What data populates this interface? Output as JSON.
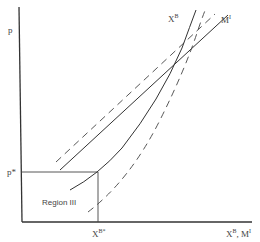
{
  "diagram": {
    "axes": {
      "y_label": "p",
      "x_label_main": "X",
      "x_label_main_sup": "B",
      "x_label_sep": ", ",
      "x_label_second": "M",
      "x_label_second_sup": "I"
    },
    "markers": {
      "p_star": "p*",
      "xb_star_main": "X",
      "xb_star_sup": "B*"
    },
    "region": {
      "label": "Region III"
    },
    "curves": {
      "xb_label_main": "X",
      "xb_label_sup": "B",
      "mi_label_main": "M",
      "mi_label_sup": "I",
      "items": [
        {
          "name": "X^B supply (solid)",
          "style": "solid"
        },
        {
          "name": "X^B shifted (dashed)",
          "style": "dashed"
        },
        {
          "name": "M^I import (solid)",
          "style": "solid"
        },
        {
          "name": "M^I shifted (dashed)",
          "style": "dashed"
        }
      ]
    },
    "colors": {
      "line": "#333333",
      "text": "#444444",
      "background": "#ffffff"
    }
  }
}
